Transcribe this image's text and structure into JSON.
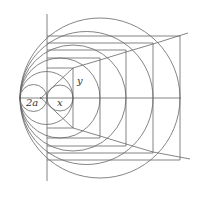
{
  "diagram": {
    "type": "geometric-construction",
    "stroke_color": "#555555",
    "labels": {
      "small_diameter": "2a",
      "horizontal_segment": "x",
      "vertical_segment": "y"
    },
    "tangent_point": [
      20,
      98
    ],
    "axis_y": 98,
    "chord_line_x": 47,
    "circle_right_edges": [
      47,
      73,
      100,
      126,
      153,
      180
    ],
    "small_circle_x_right_edge": 73,
    "rect_tops": [
      68,
      58,
      50,
      43,
      36
    ]
  }
}
